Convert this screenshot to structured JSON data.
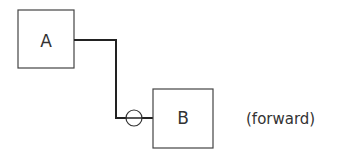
{
  "diagram": {
    "nodes": [
      {
        "id": "A",
        "label": "A"
      },
      {
        "id": "B",
        "label": "B"
      }
    ],
    "connection": {
      "from": "A",
      "to": "B",
      "symbol": "circle"
    },
    "annotation": "(forward)"
  },
  "colors": {
    "stroke": "#333333",
    "background": "#ffffff"
  }
}
